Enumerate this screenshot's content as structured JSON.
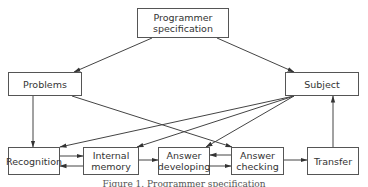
{
  "diagram": {
    "type": "flow-diagram",
    "nodes": {
      "programmer_spec": "Programmer\nspecification",
      "problems": "Problems",
      "subject": "Subject",
      "recognition": "Recognition",
      "internal_memory": "Internal\nmemory",
      "answer_developing": "Answer\ndeveloping",
      "answer_checking": "Answer\nchecking",
      "transfer": "Transfer"
    },
    "edges": [
      [
        "Programmer specification",
        "Problems"
      ],
      [
        "Programmer specification",
        "Subject"
      ],
      [
        "Problems",
        "Recognition"
      ],
      [
        "Problems",
        "Answer checking"
      ],
      [
        "Subject",
        "Recognition"
      ],
      [
        "Subject",
        "Internal memory"
      ],
      [
        "Subject",
        "Answer developing"
      ],
      [
        "Recognition",
        "Internal memory"
      ],
      [
        "Internal memory",
        "Recognition"
      ],
      [
        "Internal memory",
        "Answer developing"
      ],
      [
        "Answer developing",
        "Answer checking"
      ],
      [
        "Answer checking",
        "Answer developing"
      ],
      [
        "Answer checking",
        "Transfer"
      ],
      [
        "Transfer",
        "Subject"
      ]
    ],
    "caption": "Figure 1. Programmer specification"
  }
}
